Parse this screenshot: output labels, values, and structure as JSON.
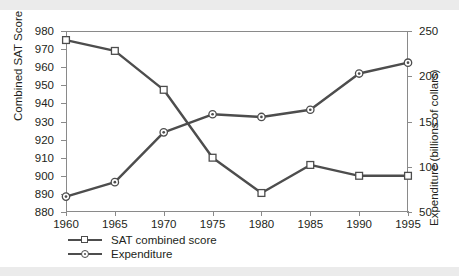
{
  "chart_data": {
    "type": "line",
    "title": "",
    "xlabel": "",
    "ylabel": "Combined SAT Score",
    "y2label": "Expenditure (billions of collars)",
    "grid": false,
    "legend_position": "bottom-left",
    "categories": [
      1960,
      1965,
      1970,
      1975,
      1980,
      1985,
      1990,
      1995
    ],
    "xtick_labels": [
      "1960",
      "1965",
      "1970",
      "1975",
      "1980",
      "1985",
      "1990",
      "1995"
    ],
    "xlim": [
      1960,
      1995
    ],
    "ylim": [
      880,
      980
    ],
    "ytick_labels": [
      "880",
      "890",
      "900",
      "910",
      "920",
      "930",
      "940",
      "950",
      "960",
      "970",
      "980"
    ],
    "ytick_values": [
      880,
      890,
      900,
      910,
      920,
      930,
      940,
      950,
      960,
      970,
      980
    ],
    "y2lim": [
      50,
      250
    ],
    "y2tick_labels": [
      "50",
      "100",
      "150",
      "200",
      "250"
    ],
    "y2tick_values": [
      50,
      100,
      150,
      200,
      250
    ],
    "series": [
      {
        "name": "SAT combined score",
        "axis": "left",
        "marker": "square",
        "color": "#4d4d4d",
        "values": [
          975,
          969,
          947.5,
          910,
          890.5,
          906,
          900,
          900
        ]
      },
      {
        "name": "Expenditure",
        "axis": "right",
        "marker": "circle",
        "color": "#4d4d4d",
        "values": [
          67,
          83,
          138,
          158,
          155,
          163,
          203,
          215
        ]
      }
    ]
  },
  "legend": {
    "items": [
      {
        "label": "SAT combined score",
        "marker": "square"
      },
      {
        "label": "Expenditure",
        "marker": "circle"
      }
    ]
  },
  "colors": {
    "line": "#4d4d4d",
    "axis": "#8a8a8a",
    "text": "#231f20",
    "background": "#ffffff",
    "band": "#ebebeb"
  }
}
